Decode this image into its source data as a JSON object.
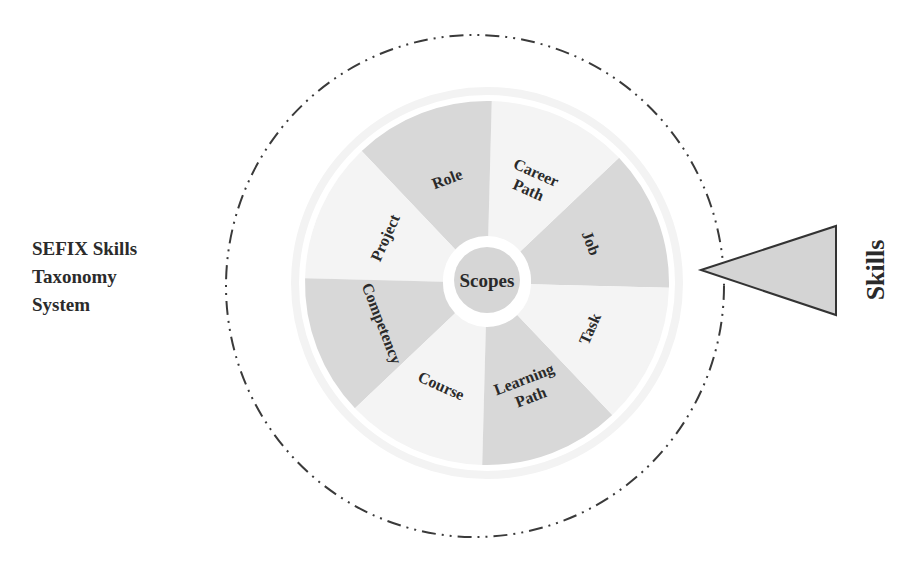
{
  "title": {
    "lines": [
      "SEFIX Skills",
      "Taxonomy",
      "System"
    ]
  },
  "center": {
    "label": "Scopes"
  },
  "sectors": [
    {
      "label": "Job",
      "lines": [
        "Job"
      ],
      "shade": "gray"
    },
    {
      "label": "Career Path",
      "lines": [
        "Career",
        "Path"
      ],
      "shade": "light"
    },
    {
      "label": "Role",
      "lines": [
        "Role"
      ],
      "shade": "gray"
    },
    {
      "label": "Project",
      "lines": [
        "Project"
      ],
      "shade": "light"
    },
    {
      "label": "Competency",
      "lines": [
        "Competency"
      ],
      "shade": "gray"
    },
    {
      "label": "Course",
      "lines": [
        "Course"
      ],
      "shade": "light"
    },
    {
      "label": "Learning Path",
      "lines": [
        "Learning",
        "Path"
      ],
      "shade": "gray"
    },
    {
      "label": "Task",
      "lines": [
        "Task"
      ],
      "shade": "light"
    }
  ],
  "pointer": {
    "label": "Skills",
    "shape": "triangle-pointing-left"
  },
  "colors": {
    "gray_sector": "#d8d8d8",
    "light_sector": "#f4f4f4",
    "center_fill": "#d6d6d6",
    "outline": "#333333",
    "text": "#2a2a2a",
    "triangle_fill": "#d4d4d4"
  }
}
